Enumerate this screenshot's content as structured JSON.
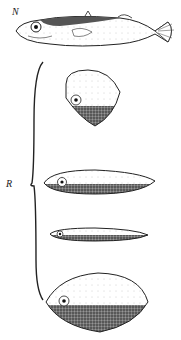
{
  "figure": {
    "labels": {
      "naturalistic": "N",
      "red_models": "R"
    },
    "models": [
      {
        "id": "N",
        "description": "naturalistic stickleback model (no red belly)"
      },
      {
        "id": "R1",
        "description": "rhomboid dummy with shaded belly"
      },
      {
        "id": "R2",
        "description": "elongated oval dummy with shaded belly"
      },
      {
        "id": "R3",
        "description": "thin elongated dummy with shaded belly"
      },
      {
        "id": "R4",
        "description": "large lemon-shaped dummy with shaded belly"
      }
    ],
    "colors": {
      "ink": "#222222",
      "shade": "#555555",
      "background": "#ffffff"
    }
  }
}
